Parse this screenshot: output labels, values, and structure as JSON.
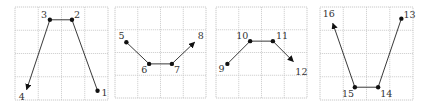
{
  "diagram": {
    "grid": {
      "cols": 4,
      "rows": 4,
      "line_color": "#c8c8c8"
    },
    "colors": {
      "line": "#222222",
      "dot": "#111111",
      "label": "#333333"
    },
    "panels": [
      {
        "id": "panel-1",
        "x": 15,
        "y": 7,
        "size": 93,
        "points": [
          {
            "label": "1",
            "col": 3.55,
            "row": 3.6,
            "kind": "dot",
            "label_dx": 4,
            "label_dy": 5
          },
          {
            "label": "2",
            "col": 2.45,
            "row": 0.55,
            "kind": "dot",
            "label_dx": 2,
            "label_dy": -2
          },
          {
            "label": "3",
            "col": 1.5,
            "row": 0.55,
            "kind": "dot",
            "label_dx": -9,
            "label_dy": -2
          },
          {
            "label": "4",
            "col": 0.5,
            "row": 3.55,
            "kind": "arrow",
            "label_dx": -8,
            "label_dy": 10
          }
        ]
      },
      {
        "id": "panel-2",
        "x": 115,
        "y": 7,
        "size": 91,
        "points": [
          {
            "label": "5",
            "col": 0.5,
            "row": 1.55,
            "kind": "dot",
            "label_dx": -8,
            "label_dy": -3
          },
          {
            "label": "6",
            "col": 1.5,
            "row": 2.5,
            "kind": "dot",
            "label_dx": -8,
            "label_dy": 9
          },
          {
            "label": "7",
            "col": 2.5,
            "row": 2.5,
            "kind": "dot",
            "label_dx": 2,
            "label_dy": 9
          },
          {
            "label": "8",
            "col": 3.5,
            "row": 1.55,
            "kind": "arrow",
            "label_dx": 3,
            "label_dy": -3
          }
        ]
      },
      {
        "id": "panel-3",
        "x": 216,
        "y": 7,
        "size": 91,
        "points": [
          {
            "label": "9",
            "col": 0.5,
            "row": 2.5,
            "kind": "dot",
            "label_dx": -9,
            "label_dy": 8
          },
          {
            "label": "10",
            "col": 1.5,
            "row": 1.5,
            "kind": "dot",
            "label_dx": -14,
            "label_dy": -2
          },
          {
            "label": "11",
            "col": 2.5,
            "row": 1.5,
            "kind": "dot",
            "label_dx": 3,
            "label_dy": -2
          },
          {
            "label": "12",
            "col": 3.4,
            "row": 2.4,
            "kind": "arrow",
            "label_dx": 2,
            "label_dy": 13
          }
        ]
      },
      {
        "id": "panel-4",
        "x": 320,
        "y": 7,
        "size": 93,
        "points": [
          {
            "label": "13",
            "col": 3.5,
            "row": 0.5,
            "kind": "dot",
            "label_dx": 2,
            "label_dy": -1
          },
          {
            "label": "14",
            "col": 2.5,
            "row": 3.45,
            "kind": "dot",
            "label_dx": 2,
            "label_dy": 10
          },
          {
            "label": "15",
            "col": 1.5,
            "row": 3.45,
            "kind": "dot",
            "label_dx": -13,
            "label_dy": 10
          },
          {
            "label": "16",
            "col": 0.55,
            "row": 0.7,
            "kind": "arrow",
            "label_dx": -10,
            "label_dy": -6
          }
        ]
      }
    ]
  }
}
